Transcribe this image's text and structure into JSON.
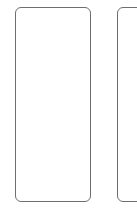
{
  "canvas": {
    "background": "#ffffff",
    "border_color": "#6e6e6e"
  },
  "cards": [
    {
      "id": "card-1",
      "content": ""
    },
    {
      "id": "card-2",
      "content": ""
    }
  ]
}
